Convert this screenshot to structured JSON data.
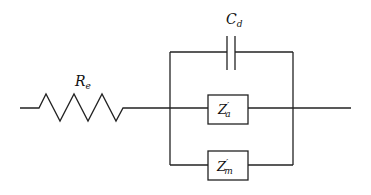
{
  "diagram": {
    "type": "equivalent-circuit",
    "components": {
      "resistor": {
        "symbol": "R",
        "subscript": "e"
      },
      "capacitor": {
        "symbol": "C",
        "subscript": "d"
      },
      "impedance_a": {
        "symbol": "Z",
        "prime": "′",
        "subscript": "a"
      },
      "impedance_m": {
        "symbol": "Z",
        "prime": "′",
        "subscript": "m"
      }
    },
    "topology": "R_e in series with parallel(C_d, Z'_a, Z'_m)",
    "colors": {
      "line": "#222222",
      "background": "#ffffff"
    }
  }
}
